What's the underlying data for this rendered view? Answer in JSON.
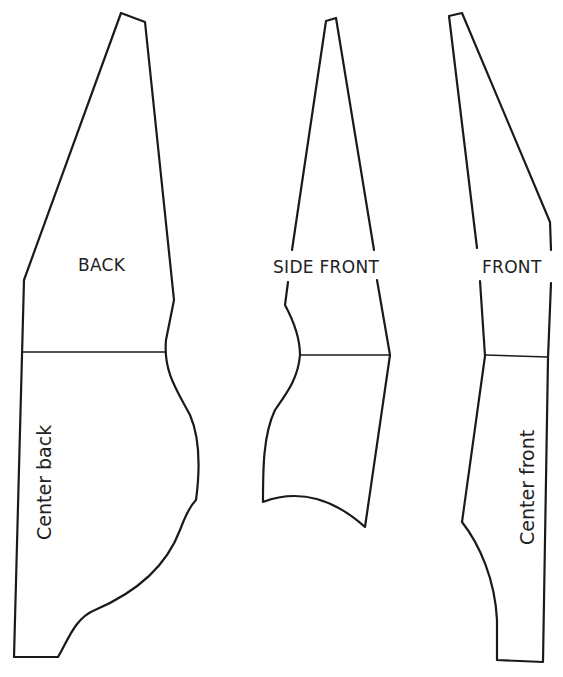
{
  "diagram": {
    "type": "sewing-pattern-pieces",
    "pieces": [
      {
        "id": "back",
        "label": "BACK",
        "edge_label": "Center back",
        "edge_label_orientation": "vertical"
      },
      {
        "id": "side-front",
        "label": "SIDE FRONT"
      },
      {
        "id": "front",
        "label": "FRONT",
        "edge_label": "Center front",
        "edge_label_orientation": "vertical"
      }
    ],
    "colors": {
      "line": "#1a1a1a",
      "text": "#222222",
      "background": "#ffffff"
    }
  }
}
